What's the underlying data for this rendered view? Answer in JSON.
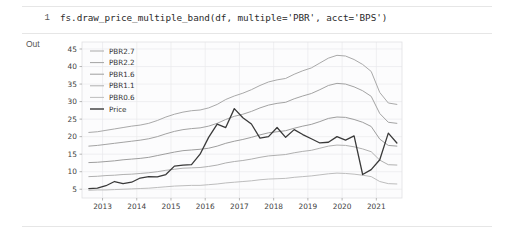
{
  "notebook": {
    "input_prompt": "1",
    "output_prompt": "Out",
    "code": "fs.draw_price_multiple_band(df, multiple='PBR', acct='BPS')"
  },
  "chart_data": {
    "type": "line",
    "title": "",
    "xlabel": "",
    "ylabel": "",
    "xlim": [
      2012.4,
      2021.75
    ],
    "ylim": [
      2.5,
      47
    ],
    "grid": true,
    "legend_position": "upper-left",
    "xticks": [
      "2013",
      "2014",
      "2015",
      "2016",
      "2017",
      "2018",
      "2019",
      "2020",
      "2021"
    ],
    "xtick_values": [
      2013,
      2014,
      2015,
      2016,
      2017,
      2018,
      2019,
      2020,
      2021
    ],
    "yticks": [
      "5",
      "10",
      "15",
      "20",
      "25",
      "30",
      "35",
      "40",
      "45"
    ],
    "ytick_values": [
      5,
      10,
      15,
      20,
      25,
      30,
      35,
      40,
      45
    ],
    "x": [
      2012.6,
      2012.85,
      2013.1,
      2013.35,
      2013.6,
      2013.85,
      2014.1,
      2014.35,
      2014.6,
      2014.85,
      2015.1,
      2015.35,
      2015.6,
      2015.85,
      2016.1,
      2016.35,
      2016.6,
      2016.85,
      2017.1,
      2017.35,
      2017.6,
      2017.85,
      2018.1,
      2018.35,
      2018.6,
      2018.85,
      2019.1,
      2019.35,
      2019.6,
      2019.85,
      2020.1,
      2020.35,
      2020.6,
      2020.85,
      2021.1,
      2021.35,
      2021.6
    ],
    "series": [
      {
        "name": "PBR2.7",
        "color": "#a9a9a9",
        "width": 1.0,
        "values": [
          21.2,
          21.4,
          21.8,
          22.2,
          22.6,
          23.0,
          23.3,
          23.8,
          24.6,
          25.6,
          26.4,
          27.0,
          27.4,
          27.6,
          28.2,
          29.2,
          30.6,
          31.6,
          32.4,
          33.4,
          34.6,
          35.6,
          36.2,
          36.6,
          37.8,
          38.8,
          39.6,
          41.0,
          42.4,
          43.2,
          43.0,
          42.0,
          40.6,
          38.6,
          32.6,
          29.6,
          29.2
        ]
      },
      {
        "name": "PBR2.2",
        "color": "#a3a3a3",
        "width": 1.0,
        "values": [
          17.3,
          17.5,
          17.8,
          18.1,
          18.4,
          18.7,
          19.0,
          19.4,
          20.0,
          20.8,
          21.5,
          22.0,
          22.3,
          22.5,
          23.0,
          23.8,
          24.9,
          25.8,
          26.4,
          27.2,
          28.2,
          29.0,
          29.5,
          29.8,
          30.8,
          31.6,
          32.3,
          33.4,
          34.6,
          35.2,
          35.0,
          34.2,
          33.1,
          31.5,
          26.6,
          24.1,
          23.8
        ]
      },
      {
        "name": "PBR1.6",
        "color": "#9e9e9e",
        "width": 1.0,
        "values": [
          12.6,
          12.7,
          12.9,
          13.1,
          13.4,
          13.6,
          13.8,
          14.1,
          14.6,
          15.1,
          15.6,
          16.0,
          16.2,
          16.4,
          16.7,
          17.3,
          18.1,
          18.7,
          19.2,
          19.8,
          20.5,
          21.1,
          21.4,
          21.7,
          22.4,
          23.0,
          23.5,
          24.3,
          25.2,
          25.6,
          25.5,
          24.9,
          24.1,
          22.9,
          19.3,
          17.5,
          17.3
        ]
      },
      {
        "name": "PBR1.1",
        "color": "#b0b0b0",
        "width": 1.0,
        "values": [
          8.6,
          8.7,
          8.9,
          9.0,
          9.2,
          9.3,
          9.5,
          9.7,
          10.0,
          10.4,
          10.7,
          11.0,
          11.1,
          11.2,
          11.5,
          11.9,
          12.5,
          12.9,
          13.2,
          13.6,
          14.1,
          14.5,
          14.7,
          14.9,
          15.4,
          15.8,
          16.1,
          16.7,
          17.3,
          17.6,
          17.5,
          17.1,
          16.5,
          15.7,
          13.3,
          12.0,
          11.9
        ]
      },
      {
        "name": "PBR0.6",
        "color": "#bdbdbd",
        "width": 1.0,
        "values": [
          4.7,
          4.8,
          4.8,
          4.9,
          5.0,
          5.1,
          5.2,
          5.3,
          5.5,
          5.7,
          5.9,
          6.0,
          6.1,
          6.1,
          6.3,
          6.5,
          6.8,
          7.0,
          7.2,
          7.4,
          7.7,
          7.9,
          8.0,
          8.1,
          8.4,
          8.6,
          8.8,
          9.1,
          9.4,
          9.6,
          9.5,
          9.3,
          9.0,
          8.6,
          7.2,
          6.6,
          6.5
        ]
      },
      {
        "name": "Price",
        "color": "#3a3a3a",
        "width": 1.3,
        "values": [
          5.2,
          5.3,
          6.0,
          7.2,
          6.6,
          7.0,
          8.2,
          8.6,
          8.5,
          9.2,
          11.6,
          11.9,
          12.0,
          15.0,
          19.8,
          23.6,
          22.6,
          28.0,
          25.4,
          23.6,
          19.6,
          20.0,
          22.6,
          19.8,
          22.0,
          20.6,
          19.4,
          18.2,
          18.4,
          20.0,
          19.0,
          20.2,
          9.2,
          10.6,
          13.4,
          21.0,
          18.2
        ]
      }
    ],
    "legend": [
      {
        "label": "PBR2.7",
        "color": "#a9a9a9"
      },
      {
        "label": "PBR2.2",
        "color": "#a3a3a3"
      },
      {
        "label": "PBR1.6",
        "color": "#9e9e9e"
      },
      {
        "label": "PBR1.1",
        "color": "#b0b0b0"
      },
      {
        "label": "PBR0.6",
        "color": "#bdbdbd"
      },
      {
        "label": "Price",
        "color": "#3a3a3a"
      }
    ]
  }
}
